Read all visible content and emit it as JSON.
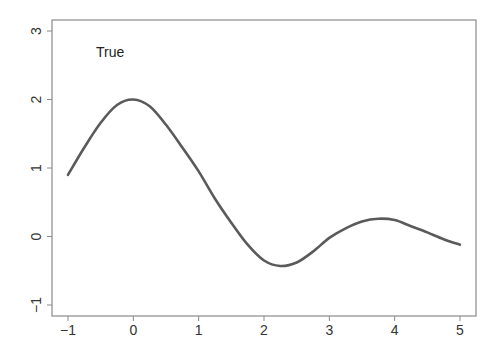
{
  "chart_data": {
    "type": "line",
    "title": "",
    "xlabel": "",
    "ylabel": "",
    "xlim": [
      -1.24,
      5.36
    ],
    "ylim": [
      -1.16,
      3.16
    ],
    "grid": false,
    "legend": null,
    "annotations": [
      {
        "text": "True",
        "x": -0.55,
        "y": 2.7
      }
    ],
    "x_ticks": [
      -1,
      0,
      1,
      2,
      3,
      4,
      5
    ],
    "y_ticks": [
      -1,
      0,
      1,
      2,
      3
    ],
    "x_tick_labels": [
      "−1",
      "0",
      "1",
      "2",
      "3",
      "4",
      "5"
    ],
    "y_tick_labels": [
      "−1",
      "0",
      "1",
      "2",
      "3"
    ],
    "series": [
      {
        "name": "True",
        "color": "#5a5a5a",
        "x": [
          -1.0,
          -0.75,
          -0.5,
          -0.25,
          0.0,
          0.25,
          0.5,
          0.75,
          1.0,
          1.25,
          1.5,
          1.75,
          2.0,
          2.25,
          2.5,
          2.75,
          3.0,
          3.25,
          3.5,
          3.75,
          4.0,
          4.25,
          4.5,
          4.75,
          5.0
        ],
        "values": [
          0.9,
          1.3,
          1.66,
          1.92,
          2.0,
          1.9,
          1.63,
          1.3,
          0.95,
          0.55,
          0.2,
          -0.12,
          -0.35,
          -0.43,
          -0.38,
          -0.22,
          -0.02,
          0.12,
          0.22,
          0.26,
          0.24,
          0.15,
          0.06,
          -0.04,
          -0.12
        ]
      }
    ]
  },
  "plot": {
    "annotation_label": "True"
  }
}
